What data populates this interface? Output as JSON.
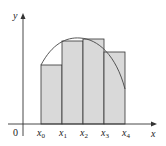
{
  "diagram": {
    "type": "riemann-sum-illustration",
    "axes": {
      "x_label": "x",
      "y_label": "y",
      "origin_label": "0"
    },
    "partition_labels": [
      {
        "base": "x",
        "sub": "0"
      },
      {
        "base": "x",
        "sub": "1"
      },
      {
        "base": "x",
        "sub": "2"
      },
      {
        "base": "x",
        "sub": "3"
      },
      {
        "base": "x",
        "sub": "4"
      }
    ],
    "rectangles": [
      {
        "from": "x0",
        "to": "x1",
        "relative_height": 0.58
      },
      {
        "from": "x1",
        "to": "x2",
        "relative_height": 0.83
      },
      {
        "from": "x2",
        "to": "x3",
        "relative_height": 0.85
      },
      {
        "from": "x3",
        "to": "x4",
        "relative_height": 0.71
      }
    ],
    "curve": "concave-down arc from left edge of first rectangle, peaking near x2, falling steeply past x4",
    "colors": {
      "rect_fill": "#d9d9d9",
      "rect_stroke": "#333333",
      "axis": "#333333",
      "curve": "#444444"
    }
  }
}
